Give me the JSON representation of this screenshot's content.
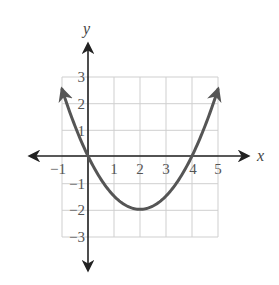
{
  "chart_data": {
    "type": "line",
    "title": "",
    "xlabel": "x",
    "ylabel": "y",
    "xlim": [
      -1,
      5
    ],
    "ylim": [
      -3,
      3
    ],
    "grid": true,
    "x_ticks": [
      "-1",
      "1",
      "2",
      "3",
      "4",
      "5"
    ],
    "y_ticks": [
      "3",
      "2",
      "1",
      "-1",
      "-2",
      "-3"
    ],
    "series": [
      {
        "name": "parabola",
        "equation": "y = 0.5x^2 - 2x",
        "x": [
          -1,
          0,
          1,
          2,
          3,
          4,
          5
        ],
        "y": [
          2.5,
          0,
          -1.5,
          -2,
          -1.5,
          0,
          2.5
        ],
        "color": "#555555",
        "arrows_at_ends": true
      }
    ]
  },
  "labels": {
    "x_axis": "x",
    "y_axis": "y",
    "x_ticks": [
      "−1",
      "1",
      "2",
      "3",
      "4",
      "5"
    ],
    "y_ticks": [
      "3",
      "2",
      "1",
      "−1",
      "−2",
      "−3"
    ]
  }
}
